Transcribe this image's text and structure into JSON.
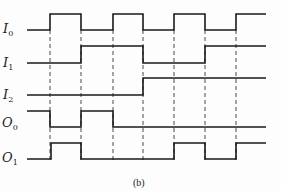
{
  "figure": {
    "caption": "(b)",
    "signals": [
      {
        "name": "I",
        "sub": "0",
        "label_y": 22
      },
      {
        "name": "I",
        "sub": "1",
        "label_y": 56
      },
      {
        "name": "I",
        "sub": "2",
        "label_y": 88
      },
      {
        "name": "O",
        "sub": "0",
        "label_y": 116
      },
      {
        "name": "O",
        "sub": "1",
        "label_y": 151
      }
    ],
    "time_marks_x": [
      50,
      81,
      113,
      143,
      174,
      205,
      236
    ],
    "waveforms": {
      "I0": {
        "high_y": 14,
        "low_y": 30,
        "levels": [
          "L",
          "H",
          "L",
          "H",
          "L",
          "H",
          "L",
          "H"
        ]
      },
      "I1": {
        "high_y": 46,
        "low_y": 63,
        "levels": [
          "L",
          "L",
          "H",
          "H",
          "L",
          "L",
          "H",
          "H"
        ]
      },
      "I2": {
        "high_y": 78,
        "low_y": 95,
        "levels": [
          "L",
          "L",
          "L",
          "L",
          "H",
          "H",
          "H",
          "H"
        ]
      },
      "O0": {
        "high_y": 111,
        "low_y": 127,
        "levels": [
          "H",
          "L",
          "H",
          "L",
          "L",
          "L",
          "L",
          "L"
        ]
      },
      "O1": {
        "high_y": 143,
        "low_y": 159,
        "levels": [
          "L",
          "H",
          "L",
          "L",
          "L",
          "H",
          "L",
          "H"
        ]
      }
    }
  }
}
